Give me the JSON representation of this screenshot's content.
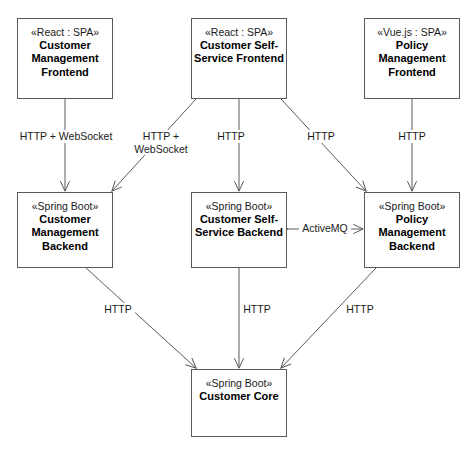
{
  "diagram": {
    "type": "uml-component-diagram",
    "background_color": "#ffffff",
    "line_color": "#5a5a5a",
    "text_color": "#000000"
  },
  "nodes": [
    {
      "id": "customer-management-frontend",
      "stereotype": "«React : SPA»",
      "title": "Customer\nManagement\nFrontend",
      "x": 17,
      "y": 18,
      "w": 96,
      "h": 81
    },
    {
      "id": "customer-self-service-frontend",
      "stereotype": "«React : SPA»",
      "title": "Customer Self-\nService  Frontend",
      "x": 191,
      "y": 18,
      "w": 96,
      "h": 81
    },
    {
      "id": "policy-management-frontend",
      "stereotype": "«Vue.js : SPA»",
      "title": "Policy\nManagement\nFrontend",
      "x": 364,
      "y": 18,
      "w": 96,
      "h": 81
    },
    {
      "id": "customer-management-backend",
      "stereotype": "«Spring Boot»",
      "title": "Customer\nManagement\nBackend",
      "x": 17,
      "y": 192,
      "w": 96,
      "h": 76
    },
    {
      "id": "customer-self-service-backend",
      "stereotype": "«Spring Boot»",
      "title": "Customer Self-\nService Backend",
      "x": 191,
      "y": 192,
      "w": 96,
      "h": 76
    },
    {
      "id": "policy-management-backend",
      "stereotype": "«Spring Boot»",
      "title": "Policy\nManagement\nBackend",
      "x": 364,
      "y": 192,
      "w": 96,
      "h": 76
    },
    {
      "id": "customer-core",
      "stereotype": "«Spring Boot»",
      "title": "Customer Core",
      "x": 191,
      "y": 369,
      "w": 96,
      "h": 68
    }
  ],
  "edges": [
    {
      "id": "cmf-to-cmb",
      "from": "customer-management-frontend",
      "to": "customer-management-backend",
      "label": "HTTP + WebSocket",
      "label_x": 15,
      "label_y": 130,
      "label_w": 102,
      "direction": "one-way"
    },
    {
      "id": "cssf-to-cmb",
      "from": "customer-self-service-frontend",
      "to": "customer-management-backend",
      "label": "HTTP +\nWebSocket",
      "label_x": 128,
      "label_y": 130,
      "label_w": 66,
      "direction": "one-way"
    },
    {
      "id": "cssf-to-cssb",
      "from": "customer-self-service-frontend",
      "to": "customer-self-service-backend",
      "label": "HTTP",
      "label_x": 214,
      "label_y": 130,
      "label_w": 34,
      "direction": "one-way"
    },
    {
      "id": "cssf-to-pmb",
      "from": "customer-self-service-frontend",
      "to": "policy-management-backend",
      "label": "HTTP",
      "label_x": 304,
      "label_y": 130,
      "label_w": 34,
      "direction": "one-way"
    },
    {
      "id": "pmf-to-pmb",
      "from": "policy-management-frontend",
      "to": "policy-management-backend",
      "label": "HTTP",
      "label_x": 395,
      "label_y": 130,
      "label_w": 34,
      "direction": "one-way"
    },
    {
      "id": "cssb-to-pmb",
      "from": "customer-self-service-backend",
      "to": "policy-management-backend",
      "label": "ActiveMQ",
      "label_x": 299,
      "label_y": 216,
      "label_w": 52,
      "direction": "two-way"
    },
    {
      "id": "cmb-to-core",
      "from": "customer-management-backend",
      "to": "customer-core",
      "label": "HTTP",
      "label_x": 101,
      "label_y": 303,
      "label_w": 34,
      "direction": "one-way"
    },
    {
      "id": "cssb-to-core",
      "from": "customer-self-service-backend",
      "to": "customer-core",
      "label": "HTTP",
      "label_x": 240,
      "label_y": 303,
      "label_w": 34,
      "direction": "one-way"
    },
    {
      "id": "pmb-to-core",
      "from": "policy-management-backend",
      "to": "customer-core",
      "label": "HTTP",
      "label_x": 343,
      "label_y": 303,
      "label_w": 34,
      "direction": "one-way"
    }
  ]
}
